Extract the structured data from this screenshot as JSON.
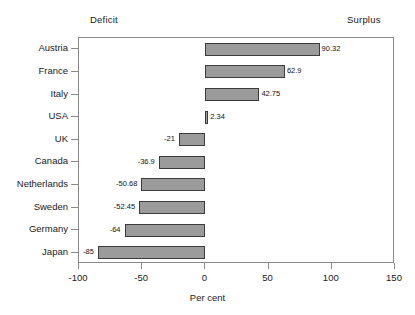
{
  "headers": {
    "left": "Deficit",
    "right": "Surplus"
  },
  "axis": {
    "x_title": "Per cent",
    "ticks": [
      "-100",
      "-50",
      "0",
      "50",
      "100",
      "150"
    ]
  },
  "colors": {
    "bar_fill": "#9b9b9b",
    "bar_border": "#3c3c3c",
    "frame": "#8a8a8a",
    "text": "#1a1a1a"
  },
  "chart_data": {
    "type": "bar",
    "orientation": "horizontal",
    "title": "",
    "subtitle": "",
    "xlabel": "Per cent",
    "ylabel": "",
    "xlim": [
      -100,
      150
    ],
    "xticks": [
      -100,
      -50,
      0,
      50,
      100,
      150
    ],
    "grid": false,
    "legend": null,
    "annotations": [
      "Deficit",
      "Surplus"
    ],
    "categories": [
      "Austria",
      "France",
      "Italy",
      "USA",
      "UK",
      "Canada",
      "Netherlands",
      "Sweden",
      "Germany",
      "Japan"
    ],
    "values": [
      90.32,
      62.9,
      42.75,
      2.34,
      -21,
      -36.9,
      -50.68,
      -52.45,
      -64,
      -85
    ],
    "value_labels": [
      "90.32",
      "62.9",
      "42.75",
      "2.34",
      "-21",
      "-36.9",
      "-50.68",
      "-52.45",
      "-64",
      "-85"
    ]
  }
}
